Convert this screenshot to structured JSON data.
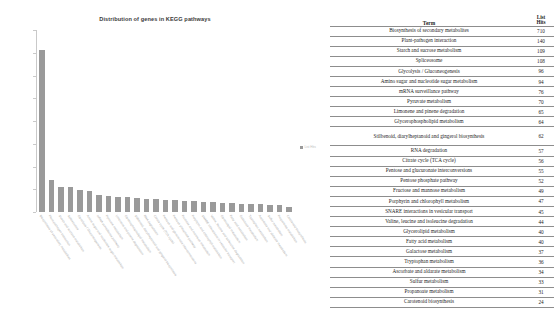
{
  "chart": {
    "title": "Distribution of genes in KEGG pathways",
    "legend_label": "List Hits",
    "y_ticks": [
      "800",
      "700",
      "600",
      "500",
      "400",
      "300",
      "200",
      "100",
      "0"
    ]
  },
  "table": {
    "term_header": "Term",
    "hits_header_line1": "List",
    "hits_header_line2": "Hits"
  },
  "chart_data": {
    "type": "bar",
    "title": "Distribution of genes in KEGG pathways",
    "xlabel": "",
    "ylabel": "",
    "ylim": [
      0,
      800
    ],
    "grid": false,
    "legend_position": "right",
    "series": [
      {
        "name": "List Hits",
        "values": [
          710,
          140,
          109,
          108,
          96,
          94,
          76,
          70,
          65,
          64,
          62,
          57,
          56,
          55,
          52,
          49,
          47,
          45,
          44,
          40,
          40,
          37,
          36,
          34,
          33,
          31,
          24
        ]
      }
    ],
    "categories": [
      "Biosynthesis of secondary metabolites",
      "Plant-pathogen interaction",
      "Starch and sucrose metabolism",
      "Spliceosome",
      "Glycolysis / Gluconeogenesis",
      "Amino sugar and nucleotide sugar metabolism",
      "mRNA surveillance pathway",
      "Pyruvate metabolism",
      "Limonene and pinene degradation",
      "Glycerophospholipid metabolism",
      "Stilbenoid, diarylheptanoid and gingerol biosynthesis",
      "RNA degradation",
      "Citrate cycle (TCA cycle)",
      "Pentose and glucuronate interconversions",
      "Pentose phosphate pathway",
      "Fructose and mannose metabolism",
      "Porphyrin and chlorophyll metabolism",
      "SNARE interactions in vesicular transport",
      "Valine, leucine and isoleucine degradation",
      "Glycerolipid metabolism",
      "Fatty acid metabolism",
      "Galactose metabolism",
      "Tryptophan metabolism",
      "Ascorbate and aldarate metabolism",
      "Sulfur metabolism",
      "Propanoate metabolism",
      "Carotenoid biosynthesis"
    ]
  },
  "table_rows": [
    {
      "term": "Biosynthesis of secondary metabolites",
      "hits": "710",
      "tall": false
    },
    {
      "term": "Plant-pathogen interaction",
      "hits": "140",
      "tall": false
    },
    {
      "term": "Starch and sucrose metabolism",
      "hits": "109",
      "tall": false
    },
    {
      "term": "Spliceosome",
      "hits": "108",
      "tall": false
    },
    {
      "term": "Glycolysis / Gluconeogenesis",
      "hits": "96",
      "tall": false
    },
    {
      "term": "Amino sugar and nucleotide sugar metabolism",
      "hits": "94",
      "tall": false
    },
    {
      "term": "mRNA surveillance pathway",
      "hits": "76",
      "tall": false
    },
    {
      "term": "Pyruvate metabolism",
      "hits": "70",
      "tall": false
    },
    {
      "term": "Limonene and pinene degradation",
      "hits": "65",
      "tall": false
    },
    {
      "term": "Glycerophospholipid metabolism",
      "hits": "64",
      "tall": false
    },
    {
      "term": "Stilbenoid, diarylheptanoid and gingerol biosynthesis",
      "hits": "62",
      "tall": true
    },
    {
      "term": "RNA degradation",
      "hits": "57",
      "tall": false
    },
    {
      "term": "Citrate cycle (TCA cycle)",
      "hits": "56",
      "tall": false
    },
    {
      "term": "Pentose and glucuronate interconversions",
      "hits": "55",
      "tall": false
    },
    {
      "term": "Pentose phosphate pathway",
      "hits": "52",
      "tall": false
    },
    {
      "term": "Fructose and mannose metabolism",
      "hits": "49",
      "tall": false
    },
    {
      "term": "Porphyrin and chlorophyll metabolism",
      "hits": "47",
      "tall": false
    },
    {
      "term": "SNARE interactions in vesicular transport",
      "hits": "45",
      "tall": false
    },
    {
      "term": "Valine, leucine and isoleucine degradation",
      "hits": "44",
      "tall": false
    },
    {
      "term": "Glycerolipid metabolism",
      "hits": "40",
      "tall": false
    },
    {
      "term": "Fatty acid metabolism",
      "hits": "40",
      "tall": false
    },
    {
      "term": "Galactose metabolism",
      "hits": "37",
      "tall": false
    },
    {
      "term": "Tryptophan metabolism",
      "hits": "36",
      "tall": false
    },
    {
      "term": "Ascorbate and aldarate metabolism",
      "hits": "34",
      "tall": false
    },
    {
      "term": "Sulfur metabolism",
      "hits": "33",
      "tall": false
    },
    {
      "term": "Propanoate metabolism",
      "hits": "31",
      "tall": false
    },
    {
      "term": "Carotenoid biosynthesis",
      "hits": "24",
      "tall": false
    }
  ],
  "colors": {
    "bar": "#9a9a9a",
    "axis": "#c9c9c9",
    "tick_label": "#b9b9b9",
    "x_label": "#a8a8a8",
    "table_text": "#1d1d1d",
    "table_rule": "#8d8d8d"
  }
}
